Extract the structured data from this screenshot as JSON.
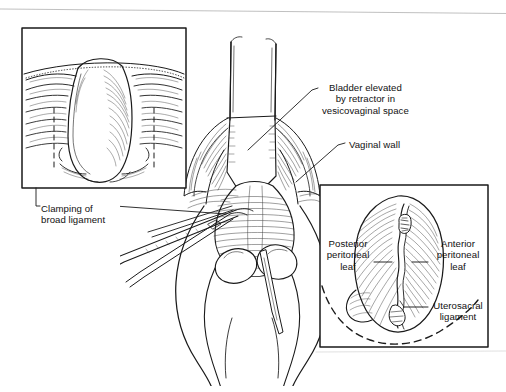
{
  "figure": {
    "kind": "surgical-line-drawing",
    "title_visible": false,
    "background_color": "#ffffff",
    "ink_color": "#111111",
    "width": 506,
    "height": 392
  },
  "labels": {
    "bladder": {
      "lines": [
        "Bladder elevated",
        "by retractor in",
        "vesicovaginal space"
      ],
      "text": "Bladder elevated\nby retractor in\nvesicovaginal space"
    },
    "vaginal_wall": {
      "lines": [
        "Vaginal wall"
      ],
      "text": "Vaginal wall"
    },
    "clamping": {
      "lines": [
        "Clamping of",
        "broad ligament"
      ],
      "text": "Clamping of\nbroad ligament"
    },
    "posterior_leaf": {
      "lines": [
        "Posterior",
        "peritoneal",
        "leaf"
      ],
      "text": "Posterior\nperitoneal\nleaf"
    },
    "anterior_leaf": {
      "lines": [
        "Anterior",
        "peritoneal",
        "leaf"
      ],
      "text": "Anterior\nperitoneal\nleaf"
    },
    "uterosacral": {
      "lines": [
        "Uterosacral",
        "ligament"
      ],
      "text": "Uterosacral\nligament"
    }
  },
  "insets": {
    "upper_left": {
      "name": "uterus-broad-ligament-inset",
      "border_color": "#1a1a1a",
      "x": 22,
      "y": 28,
      "width": 164,
      "height": 160
    },
    "lower_right": {
      "name": "peritoneal-leaves-inset",
      "border_color": "#1a1a1a",
      "x": 320,
      "y": 185,
      "width": 168,
      "height": 162
    }
  }
}
